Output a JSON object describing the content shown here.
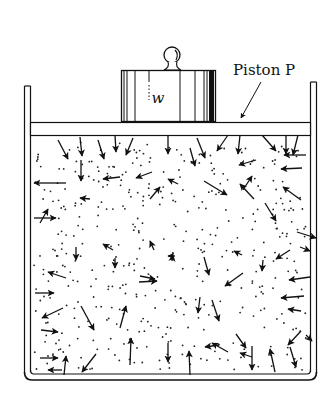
{
  "diagram": {
    "type": "gas-in-cylinder-with-piston",
    "labels": {
      "piston": "Piston P",
      "weight": "w"
    },
    "colors": {
      "ink": "#111111",
      "background": "#ffffff"
    },
    "container": {
      "outer": {
        "x": 24,
        "y": 84,
        "w": 293,
        "h": 296
      },
      "inner": {
        "x": 30,
        "y": 84,
        "w": 281,
        "h": 290
      }
    },
    "piston": {
      "x": 30,
      "y": 122,
      "w": 281,
      "h": 14
    },
    "weight_block": {
      "x": 121,
      "y": 70,
      "w": 94,
      "h": 50
    },
    "arrows": [
      [
        58,
        140,
        68,
        159
      ],
      [
        80,
        137,
        82,
        156
      ],
      [
        98,
        140,
        104,
        159
      ],
      [
        115,
        135,
        116,
        152
      ],
      [
        133,
        138,
        126,
        155
      ],
      [
        168,
        135,
        168,
        154
      ],
      [
        197,
        138,
        205,
        158
      ],
      [
        228,
        135,
        217,
        151
      ],
      [
        240,
        135,
        238,
        154
      ],
      [
        262,
        135,
        276,
        151
      ],
      [
        286,
        135,
        286,
        154
      ],
      [
        298,
        135,
        293,
        155
      ],
      [
        81,
        160,
        81,
        181
      ],
      [
        152,
        172,
        136,
        178
      ],
      [
        190,
        148,
        195,
        166
      ],
      [
        256,
        160,
        239,
        165
      ],
      [
        306,
        155,
        284,
        155
      ],
      [
        120,
        177,
        103,
        179
      ],
      [
        150,
        199,
        160,
        187
      ],
      [
        178,
        184,
        168,
        179
      ],
      [
        254,
        199,
        240,
        184
      ],
      [
        90,
        199,
        80,
        198
      ],
      [
        66,
        183,
        34,
        183
      ],
      [
        34,
        218,
        56,
        218
      ],
      [
        40,
        223,
        48,
        209
      ],
      [
        204,
        181,
        227,
        195
      ],
      [
        243,
        190,
        252,
        176
      ],
      [
        302,
        168,
        281,
        169
      ],
      [
        301,
        200,
        283,
        187
      ],
      [
        297,
        232,
        316,
        238
      ],
      [
        265,
        203,
        276,
        221
      ],
      [
        300,
        247,
        310,
        251
      ],
      [
        76,
        247,
        76,
        260
      ],
      [
        113,
        250,
        103,
        244
      ],
      [
        154,
        250,
        150,
        241
      ],
      [
        140,
        276,
        155,
        279
      ],
      [
        175,
        256,
        168,
        256
      ],
      [
        204,
        257,
        209,
        275
      ],
      [
        242,
        255,
        234,
        251
      ],
      [
        172,
        261,
        173,
        255
      ],
      [
        35,
        293,
        54,
        293
      ],
      [
        66,
        278,
        48,
        272
      ],
      [
        63,
        308,
        42,
        318
      ],
      [
        115,
        258,
        115,
        268
      ],
      [
        243,
        273,
        225,
        286
      ],
      [
        263,
        260,
        262,
        271
      ],
      [
        290,
        250,
        276,
        259
      ],
      [
        310,
        277,
        289,
        280
      ],
      [
        304,
        296,
        281,
        298
      ],
      [
        139,
        282,
        157,
        281
      ],
      [
        120,
        328,
        126,
        306
      ],
      [
        81,
        306,
        94,
        330
      ],
      [
        200,
        297,
        198,
        313
      ],
      [
        212,
        300,
        219,
        321
      ],
      [
        219,
        345,
        205,
        347
      ],
      [
        252,
        357,
        240,
        353
      ],
      [
        301,
        311,
        288,
        309
      ],
      [
        301,
        331,
        288,
        345
      ],
      [
        40,
        358,
        58,
        358
      ],
      [
        64,
        375,
        66,
        356
      ],
      [
        96,
        354,
        82,
        372
      ],
      [
        130,
        365,
        131,
        338
      ],
      [
        168,
        343,
        168,
        362
      ],
      [
        190,
        375,
        189,
        351
      ],
      [
        228,
        352,
        212,
        343
      ],
      [
        252,
        346,
        252,
        370
      ],
      [
        275,
        372,
        270,
        349
      ],
      [
        290,
        347,
        296,
        367
      ],
      [
        306,
        335,
        312,
        341
      ],
      [
        236,
        334,
        246,
        348
      ],
      [
        62,
        370,
        48,
        370
      ],
      [
        41,
        330,
        58,
        332
      ]
    ],
    "dots_seed": 1337,
    "dots_count": 420
  }
}
